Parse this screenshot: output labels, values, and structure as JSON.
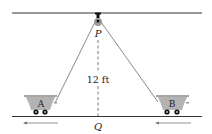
{
  "diagram": {
    "pulley_label": "P",
    "ground_point_label": "Q",
    "height_label": "12 ft",
    "cart_a_label": "A",
    "cart_b_label": "B",
    "colors": {
      "line": "#333333",
      "rope": "#8a8a8a",
      "cart_fill": "#b3b3b3",
      "pulley_fill": "#9a9a9a",
      "wheel": "#111111",
      "arrow": "#777777"
    }
  }
}
